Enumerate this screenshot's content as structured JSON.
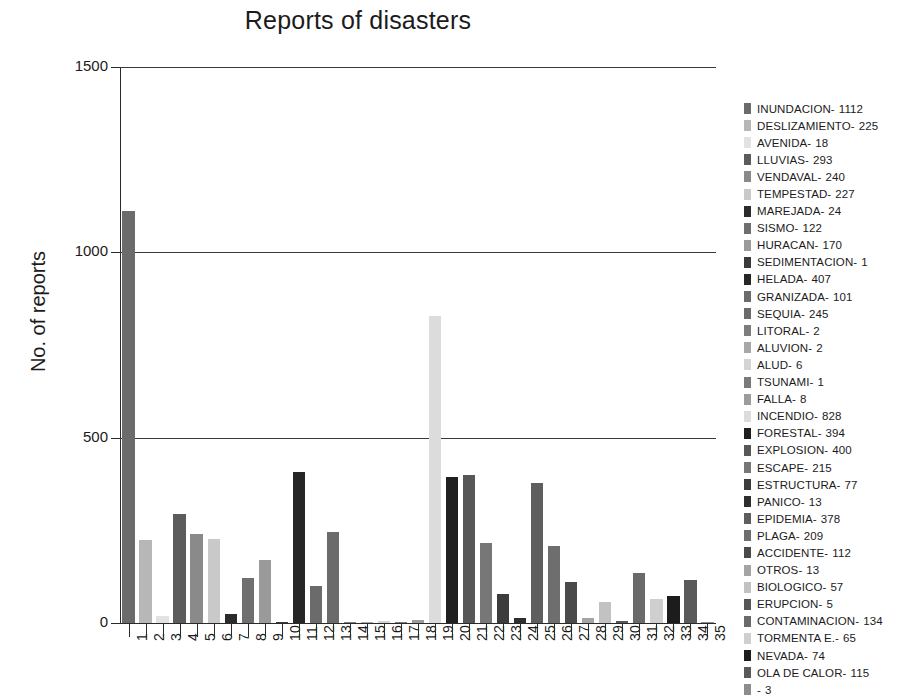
{
  "chart_data": {
    "type": "bar",
    "title": "Reports of disasters",
    "xlabel": "",
    "ylabel": "No. of reports",
    "ylim": [
      0,
      1500
    ],
    "yticks": [
      0,
      500,
      1000,
      1500
    ],
    "grid": true,
    "legend_position": "right",
    "categories": [
      "1",
      "2",
      "3",
      "4",
      "5",
      "6",
      "7",
      "8",
      "9",
      "10",
      "11",
      "12",
      "13",
      "14",
      "15",
      "16",
      "17",
      "18",
      "19",
      "20",
      "21",
      "22",
      "23",
      "24",
      "25",
      "26",
      "27",
      "28",
      "29",
      "30",
      "31",
      "32",
      "33",
      "34",
      "35"
    ],
    "series_name": "No. of reports",
    "values": [
      1112,
      225,
      18,
      293,
      240,
      227,
      24,
      122,
      170,
      1,
      407,
      101,
      245,
      2,
      2,
      6,
      1,
      8,
      828,
      394,
      400,
      215,
      77,
      13,
      378,
      209,
      112,
      13,
      57,
      5,
      134,
      65,
      74,
      115,
      3
    ],
    "labels": [
      "INUNDACION",
      "DESLIZAMIENTO",
      "AVENIDA",
      "LLUVIAS",
      "VENDAVAL",
      "TEMPESTAD",
      "MAREJADA",
      "SISMO",
      "HURACAN",
      "SEDIMENTACION",
      "HELADA",
      "GRANIZADA",
      "SEQUIA",
      "LITORAL",
      "ALUVION",
      "ALUD",
      "TSUNAMI",
      "FALLA",
      "INCENDIO",
      "FORESTAL",
      "EXPLOSION",
      "ESCAPE",
      "ESTRUCTURA",
      "PANICO",
      "EPIDEMIA",
      "PLAGA",
      "ACCIDENTE",
      "OTROS",
      "BIOLOGICO",
      "ERUPCION",
      "CONTAMINACION",
      "TORMENTA E.",
      "NEVADA",
      "OLA DE CALOR",
      ""
    ],
    "colors": [
      "#6b6b6b",
      "#b7b7b7",
      "#e2e2e2",
      "#5c5c5c",
      "#8a8a8a",
      "#c9c9c9",
      "#2b2b2b",
      "#6f6f6f",
      "#9a9a9a",
      "#3a3a3a",
      "#262626",
      "#6b6b6b",
      "#6b6b6b",
      "#7d7d7d",
      "#a8a8a8",
      "#d4d4d4",
      "#7a7a7a",
      "#9c9c9c",
      "#dcdcdc",
      "#1f1f1f",
      "#575757",
      "#777777",
      "#3c3c3c",
      "#2e2e2e",
      "#5e5e5e",
      "#6e6e6e",
      "#4a4a4a",
      "#a4a4a4",
      "#c2c2c2",
      "#565656",
      "#6a6a6a",
      "#cfcfcf",
      "#1c1c1c",
      "#5a5a5a",
      "#8d8d8d"
    ]
  },
  "title": {
    "text": "Reports of disasters"
  },
  "axes": {
    "y_title": "No. of reports",
    "y_ticks": [
      "1500",
      "1000",
      "500",
      "0"
    ],
    "x_ticks": [
      "1",
      "2",
      "3",
      "4",
      "5",
      "6",
      "7",
      "8",
      "9",
      "10",
      "11",
      "12",
      "13",
      "14",
      "15",
      "16",
      "17",
      "18",
      "19",
      "20",
      "21",
      "22",
      "23",
      "24",
      "25",
      "26",
      "27",
      "28",
      "29",
      "30",
      "31",
      "32",
      "33",
      "34",
      "35"
    ]
  },
  "legend": {
    "items": [
      {
        "label": "INUNDACION-",
        "value": "1112",
        "color": "#6b6b6b"
      },
      {
        "label": "DESLIZAMIENTO-",
        "value": "225",
        "color": "#b7b7b7"
      },
      {
        "label": "AVENIDA-",
        "value": "18",
        "color": "#e2e2e2"
      },
      {
        "label": "LLUVIAS-",
        "value": "293",
        "color": "#5c5c5c"
      },
      {
        "label": "VENDAVAL-",
        "value": "240",
        "color": "#8a8a8a"
      },
      {
        "label": "TEMPESTAD-",
        "value": "227",
        "color": "#c9c9c9"
      },
      {
        "label": "MAREJADA-",
        "value": "24",
        "color": "#2b2b2b"
      },
      {
        "label": "SISMO-",
        "value": "122",
        "color": "#6f6f6f"
      },
      {
        "label": "HURACAN-",
        "value": "170",
        "color": "#9a9a9a"
      },
      {
        "label": "SEDIMENTACION-",
        "value": "1",
        "color": "#3a3a3a"
      },
      {
        "label": "HELADA-",
        "value": "407",
        "color": "#262626"
      },
      {
        "label": "GRANIZADA-",
        "value": "101",
        "color": "#6b6b6b"
      },
      {
        "label": "SEQUIA-",
        "value": "245",
        "color": "#6b6b6b"
      },
      {
        "label": "LITORAL-",
        "value": "2",
        "color": "#7d7d7d"
      },
      {
        "label": "ALUVION-",
        "value": "2",
        "color": "#a8a8a8"
      },
      {
        "label": "ALUD-",
        "value": "6",
        "color": "#d4d4d4"
      },
      {
        "label": "TSUNAMI-",
        "value": "1",
        "color": "#7a7a7a"
      },
      {
        "label": "FALLA-",
        "value": "8",
        "color": "#9c9c9c"
      },
      {
        "label": "INCENDIO-",
        "value": "828",
        "color": "#dcdcdc"
      },
      {
        "label": "FORESTAL-",
        "value": "394",
        "color": "#1f1f1f"
      },
      {
        "label": "EXPLOSION-",
        "value": "400",
        "color": "#575757"
      },
      {
        "label": "ESCAPE-",
        "value": "215",
        "color": "#777777"
      },
      {
        "label": "ESTRUCTURA-",
        "value": "77",
        "color": "#3c3c3c"
      },
      {
        "label": "PANICO-",
        "value": "13",
        "color": "#2e2e2e"
      },
      {
        "label": "EPIDEMIA-",
        "value": "378",
        "color": "#5e5e5e"
      },
      {
        "label": "PLAGA-",
        "value": "209",
        "color": "#6e6e6e"
      },
      {
        "label": "ACCIDENTE-",
        "value": "112",
        "color": "#4a4a4a"
      },
      {
        "label": "OTROS-",
        "value": "13",
        "color": "#a4a4a4"
      },
      {
        "label": "BIOLOGICO-",
        "value": "57",
        "color": "#c2c2c2"
      },
      {
        "label": "ERUPCION-",
        "value": "5",
        "color": "#565656"
      },
      {
        "label": "CONTAMINACION-",
        "value": "134",
        "color": "#6a6a6a"
      },
      {
        "label": "TORMENTA E.-",
        "value": "65",
        "color": "#cfcfcf"
      },
      {
        "label": "NEVADA-",
        "value": "74",
        "color": "#1c1c1c"
      },
      {
        "label": "OLA DE CALOR-",
        "value": "115",
        "color": "#5a5a5a"
      },
      {
        "label": "-",
        "value": "3",
        "color": "#8d8d8d"
      }
    ]
  }
}
